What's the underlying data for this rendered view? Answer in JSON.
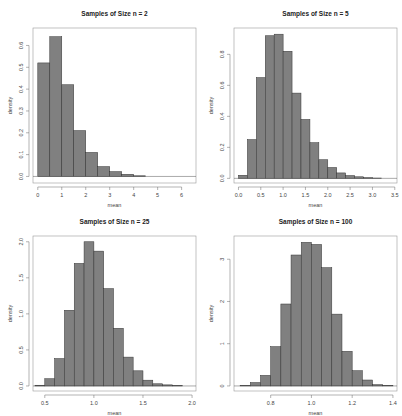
{
  "chart_data": [
    {
      "type": "bar",
      "title": "Samples of Size n = 2",
      "xlabel": "mean",
      "ylabel": "density",
      "bin_start": 0,
      "bin_width": 0.5,
      "values": [
        0.52,
        0.64,
        0.42,
        0.21,
        0.11,
        0.045,
        0.022,
        0.01,
        0.003
      ],
      "xlim": [
        -0.2,
        6.6
      ],
      "ylim": [
        -0.03,
        0.68
      ],
      "xticks": [
        0,
        1,
        2,
        3,
        4,
        5,
        6
      ],
      "xtick_labels": [
        "0",
        "1",
        "2",
        "3",
        "4",
        "5",
        "6"
      ],
      "yticks": [
        0,
        0.1,
        0.2,
        0.3,
        0.4,
        0.5,
        0.6
      ],
      "ytick_labels": [
        "0.0",
        "0.1",
        "0.2",
        "0.3",
        "0.4",
        "0.5",
        "0.6"
      ],
      "bar_color": "#808080",
      "grid": false
    },
    {
      "type": "bar",
      "title": "Samples of Size n = 5",
      "xlabel": "mean",
      "ylabel": "density",
      "bin_start": 0,
      "bin_width": 0.2,
      "values": [
        0.02,
        0.25,
        0.65,
        0.92,
        0.93,
        0.82,
        0.55,
        0.38,
        0.23,
        0.12,
        0.07,
        0.035,
        0.018,
        0.01,
        0.005,
        0.002
      ],
      "xlim": [
        -0.1,
        3.55
      ],
      "ylim": [
        -0.03,
        0.97
      ],
      "xticks": [
        0,
        0.5,
        1.0,
        1.5,
        2.0,
        2.5,
        3.0,
        3.5
      ],
      "xtick_labels": [
        "0.0",
        "0.5",
        "1.0",
        "1.5",
        "2.0",
        "2.5",
        "3.0",
        "3.5"
      ],
      "yticks": [
        0,
        0.2,
        0.4,
        0.6,
        0.8
      ],
      "ytick_labels": [
        "0.0",
        "0.2",
        "0.4",
        "0.6",
        "0.8"
      ],
      "bar_color": "#808080",
      "grid": false
    },
    {
      "type": "bar",
      "title": "Samples of Size n = 25",
      "xlabel": "mean",
      "ylabel": "density",
      "bin_start": 0.4,
      "bin_width": 0.1,
      "values": [
        0.01,
        0.1,
        0.38,
        1.05,
        1.7,
        2.0,
        1.87,
        1.35,
        0.8,
        0.4,
        0.21,
        0.08,
        0.03,
        0.015,
        0.005
      ],
      "xlim": [
        0.38,
        2.04
      ],
      "ylim": [
        -0.07,
        2.08
      ],
      "xticks": [
        0.5,
        1.0,
        1.5,
        2.0
      ],
      "xtick_labels": [
        "0.5",
        "1.0",
        "1.5",
        "2.0"
      ],
      "yticks": [
        0,
        0.5,
        1.0,
        1.5,
        2.0
      ],
      "ytick_labels": [
        "0.0",
        "0.5",
        "1.0",
        "1.5",
        "2.0"
      ],
      "bar_color": "#808080",
      "grid": false
    },
    {
      "type": "bar",
      "title": "Samples of Size n = 100",
      "xlabel": "mean",
      "ylabel": "density",
      "bin_start": 0.65,
      "bin_width": 0.05,
      "values": [
        0.01,
        0.08,
        0.25,
        0.93,
        1.94,
        3.1,
        3.4,
        3.35,
        2.8,
        1.7,
        0.82,
        0.36,
        0.14,
        0.03,
        0.01
      ],
      "xlim": [
        0.62,
        1.42
      ],
      "ylim": [
        -0.12,
        3.55
      ],
      "xticks": [
        0.8,
        1.0,
        1.2,
        1.4
      ],
      "xtick_labels": [
        "0.8",
        "1.0",
        "1.2",
        "1.4"
      ],
      "yticks": [
        0,
        1,
        2,
        3
      ],
      "ytick_labels": [
        "0",
        "1",
        "2",
        "3"
      ],
      "bar_color": "#808080",
      "grid": false
    }
  ]
}
